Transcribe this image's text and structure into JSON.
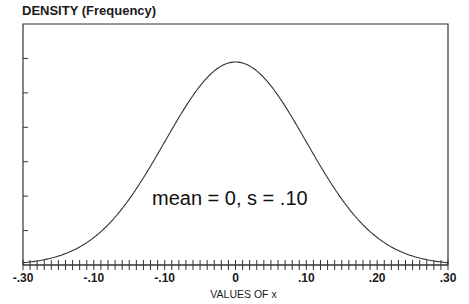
{
  "chart_data": {
    "type": "line",
    "title": "DENSITY (Frequency)",
    "xlabel": "VALUES OF x",
    "ylabel": "DENSITY (Frequency)",
    "annotation": "mean = 0, s = .10",
    "distribution": {
      "kind": "normal",
      "mean": 0,
      "sd": 0.1
    },
    "xlim": [
      -0.3,
      0.3
    ],
    "x_tick_labels": [
      {
        "pos": -0.3,
        "label": "-.30"
      },
      {
        "pos": -0.2,
        "label": "-.10"
      },
      {
        "pos": -0.1,
        "label": "-.10"
      },
      {
        "pos": 0.0,
        "label": "0"
      },
      {
        "pos": 0.1,
        "label": ".10"
      },
      {
        "pos": 0.2,
        "label": ".20"
      },
      {
        "pos": 0.3,
        "label": ".30"
      }
    ],
    "minor_tick_step": 0.01,
    "y_ticks_count": 6,
    "y_tick_labels": [],
    "grid": false,
    "legend": null,
    "x": [
      -0.3,
      -0.25,
      -0.2,
      -0.15,
      -0.1,
      -0.05,
      0.0,
      0.05,
      0.1,
      0.15,
      0.2,
      0.25,
      0.3
    ],
    "values": [
      0.044,
      0.175,
      0.54,
      1.295,
      2.42,
      3.521,
      3.989,
      3.521,
      2.42,
      1.295,
      0.54,
      0.175,
      0.044
    ]
  },
  "colors": {
    "line": "#333333",
    "text": "#1a1a1a"
  }
}
